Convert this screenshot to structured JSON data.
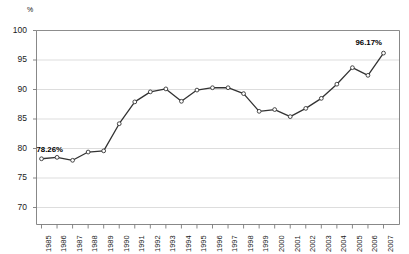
{
  "chart_data": {
    "type": "line",
    "title": "",
    "xlabel": "",
    "ylabel": "%",
    "ylim": [
      70,
      100
    ],
    "ytick_step": 5,
    "yticks": [
      100,
      95,
      90,
      85,
      80,
      75,
      70
    ],
    "grid": true,
    "legend": "none",
    "categories": [
      "1985",
      "1986",
      "1987",
      "1988",
      "1989",
      "1990",
      "1991",
      "1992",
      "1993",
      "1994",
      "1995",
      "1996",
      "1997",
      "1998",
      "1999",
      "2000",
      "2001",
      "2002",
      "2003",
      "2004",
      "2005",
      "2006",
      "2007"
    ],
    "values": [
      78.26,
      78.5,
      78.0,
      79.4,
      79.6,
      84.2,
      87.9,
      89.6,
      90.1,
      88.0,
      89.9,
      90.3,
      90.3,
      89.3,
      86.3,
      86.6,
      85.4,
      86.8,
      88.5,
      90.9,
      93.7,
      92.4,
      96.17
    ],
    "annotations": [
      {
        "category": "1985",
        "value": 78.26,
        "text": "78.26%"
      },
      {
        "category": "2007",
        "value": 96.17,
        "text": "96.17%"
      }
    ],
    "series_name": "percent",
    "line_color": "#333333",
    "marker_fill": "#ffffff",
    "marker_edge": "#333333",
    "grid_color": "#d9d9d9",
    "axis_color": "#808080"
  },
  "axis": {
    "y_unit_label": "%"
  }
}
